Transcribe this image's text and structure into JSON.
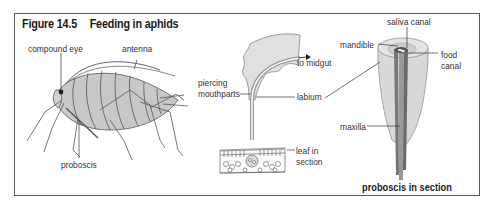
{
  "figure": {
    "number": "Figure 14.5",
    "title": "Feeding in aphids"
  },
  "aphid": {
    "labels": {
      "compound_eye": "compound eye",
      "antenna": "antenna",
      "proboscis": "proboscis"
    }
  },
  "feeding_section": {
    "labels": {
      "piercing_mouthparts_line1": "piercing",
      "piercing_mouthparts_line2": "mouthparts",
      "to_midgut": "to midgut",
      "labium": "labium",
      "leaf_line1": "leaf in",
      "leaf_line2": "section"
    }
  },
  "proboscis_section": {
    "labels": {
      "saliva_canal": "saliva canal",
      "mandible": "mandible",
      "food_line1": "food",
      "food_line2": "canal",
      "maxilla": "maxilla"
    },
    "caption": "proboscis in section"
  },
  "colors": {
    "frame": "#5a5a5a",
    "body_fill": "#c8c8c8",
    "tissue_fill": "#e0e0e0",
    "stylet_dark": "#8a8a8a",
    "line": "#555555",
    "text": "#333333"
  }
}
